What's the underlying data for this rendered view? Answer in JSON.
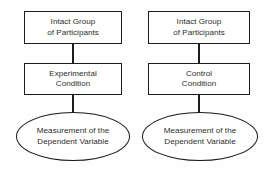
{
  "diagram": {
    "type": "flowchart",
    "orientation": "two-parallel-vertical-flows",
    "canvas": {
      "width": 268,
      "height": 179,
      "background": "#fefefe"
    },
    "style": {
      "border_color": "#1c1c1c",
      "text_color": "#2e2e2e",
      "node_fill": "#ffffff"
    },
    "columns": [
      {
        "name": "experimental-branch",
        "nodes": [
          {
            "id": "box-intact-left",
            "shape": "rectangle",
            "lines": [
              "Intact Group",
              "of Participants"
            ]
          },
          {
            "id": "box-experimental",
            "shape": "rectangle",
            "lines": [
              "Experimental",
              "Condition"
            ]
          },
          {
            "id": "ellipse-measure-left",
            "shape": "ellipse",
            "lines": [
              "Measurement of the",
              "Dependent Variable"
            ]
          }
        ]
      },
      {
        "name": "control-branch",
        "nodes": [
          {
            "id": "box-intact-right",
            "shape": "rectangle",
            "lines": [
              "Intact Group",
              "of Participants"
            ]
          },
          {
            "id": "box-control",
            "shape": "rectangle",
            "lines": [
              "Control",
              "Condition"
            ]
          },
          {
            "id": "ellipse-measure-right",
            "shape": "ellipse",
            "lines": [
              "Measurement of the",
              "Dependent Variable"
            ]
          }
        ]
      }
    ],
    "connectors": [
      {
        "id": "conn-left-top",
        "from": "box-intact-left",
        "to": "box-experimental"
      },
      {
        "id": "conn-left-bottom",
        "from": "box-experimental",
        "to": "ellipse-measure-left"
      },
      {
        "id": "conn-right-top",
        "from": "box-intact-right",
        "to": "box-control"
      },
      {
        "id": "conn-right-bottom",
        "from": "box-control",
        "to": "ellipse-measure-right"
      }
    ]
  }
}
